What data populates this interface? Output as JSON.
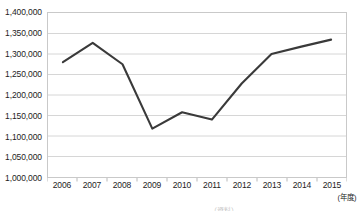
{
  "chart_data": {
    "type": "line",
    "title": "",
    "xlabel": "",
    "ylabel": "",
    "x_unit_label": "(年度)",
    "categories": [
      "2006",
      "2007",
      "2008",
      "2009",
      "2010",
      "2011",
      "2012",
      "2013",
      "2014",
      "2015"
    ],
    "values": [
      1280000,
      1327000,
      1275000,
      1118000,
      1158000,
      1140000,
      1228000,
      1300000,
      1318000,
      1335000
    ],
    "series": [
      {
        "name": "",
        "values": [
          1280000,
          1327000,
          1275000,
          1118000,
          1158000,
          1140000,
          1228000,
          1300000,
          1318000,
          1335000
        ]
      }
    ],
    "ylim": [
      1000000,
      1400000
    ],
    "ytick_step": 50000,
    "ytick_labels": [
      "1,400,000",
      "1,350,000",
      "1,300,000",
      "1,250,000",
      "1,200,000",
      "1,150,000",
      "1,100,000",
      "1,050,000",
      "1,000,000"
    ],
    "ytick_values": [
      1400000,
      1350000,
      1300000,
      1250000,
      1200000,
      1150000,
      1100000,
      1050000,
      1000000
    ],
    "grid": true,
    "grid_axis": "y",
    "legend": false,
    "legend_position": "none",
    "line_color": "#3a3a3a",
    "grid_color": "#d6d6d6",
    "frame_color": "#c9c9c9",
    "markers": false
  },
  "caption": {
    "clipped_footnote": "（資料）"
  }
}
